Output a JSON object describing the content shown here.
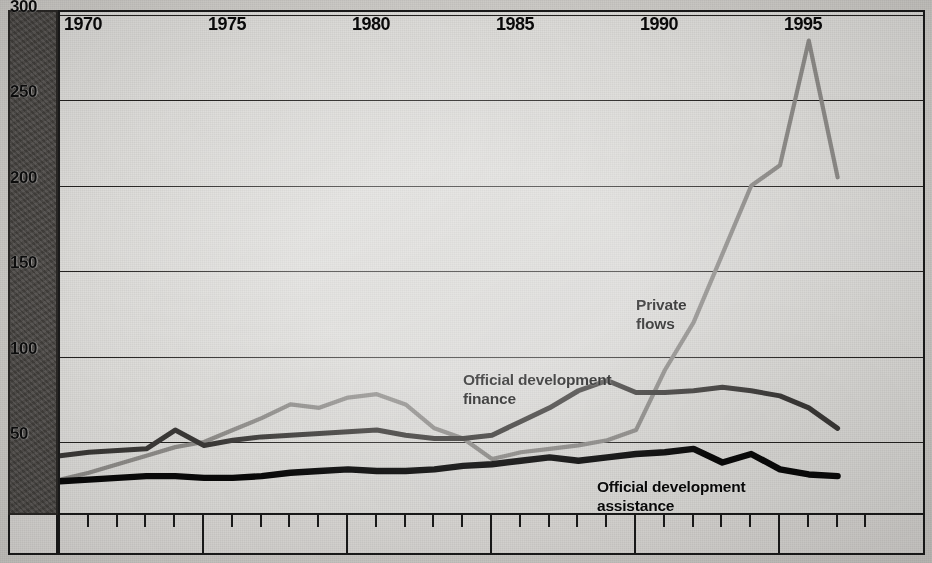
{
  "chart_data": {
    "type": "line",
    "title": "",
    "subtitle": "",
    "xlabel": "",
    "ylabel": "",
    "xlim": [
      1969,
      1998
    ],
    "ylim": [
      0,
      300
    ],
    "grid": true,
    "legend_position": "inline-annotations",
    "y_ticks": [
      50,
      100,
      150,
      200,
      250,
      300
    ],
    "y_tick_labels": [
      "50",
      "100",
      "150",
      "200",
      "250",
      "300"
    ],
    "x_ticks": [
      1970,
      1975,
      1980,
      1985,
      1990,
      1995
    ],
    "x_tick_labels": [
      "1970",
      "1975",
      "1980",
      "1985",
      "1990",
      "1995"
    ],
    "x_minor_tick_interval": 1,
    "x": [
      1970,
      1971,
      1972,
      1973,
      1974,
      1975,
      1976,
      1977,
      1978,
      1979,
      1980,
      1981,
      1982,
      1983,
      1984,
      1985,
      1986,
      1987,
      1988,
      1989,
      1990,
      1991,
      1992,
      1993,
      1994,
      1995,
      1996,
      1997
    ],
    "series": [
      {
        "name": "Private flows",
        "color": "#8e8c89",
        "label": "Private\nflows",
        "values": [
          28,
          32,
          37,
          42,
          47,
          50,
          57,
          64,
          72,
          70,
          76,
          78,
          72,
          58,
          52,
          40,
          44,
          46,
          48,
          51,
          57,
          92,
          120,
          160,
          200,
          212,
          285,
          205
        ]
      },
      {
        "name": "Official development finance",
        "color": "#3b3937",
        "label": "Official development\nfinance",
        "values": [
          42,
          44,
          45,
          46,
          57,
          48,
          51,
          53,
          54,
          55,
          56,
          57,
          54,
          52,
          52,
          54,
          62,
          70,
          80,
          86,
          79,
          79,
          80,
          82,
          80,
          77,
          70,
          58
        ]
      },
      {
        "name": "Official development assistance",
        "color": "#090909",
        "label": "Official development\nassistance",
        "values": [
          27,
          28,
          29,
          30,
          30,
          29,
          29,
          30,
          32,
          33,
          34,
          33,
          33,
          34,
          36,
          37,
          39,
          41,
          39,
          41,
          43,
          44,
          46,
          38,
          43,
          34,
          31,
          30
        ]
      }
    ]
  }
}
